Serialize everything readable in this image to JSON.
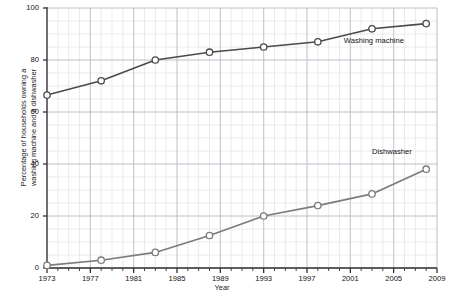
{
  "chart_data": {
    "type": "line",
    "title": "",
    "xlabel": "Year",
    "ylabel": "Percentage of households owning a washing machine and a dishwasher",
    "ylabel_line1": "Percentage of households owning a",
    "ylabel_line2": "washing machine and a dishwasher",
    "xlim": [
      1973,
      2009
    ],
    "ylim": [
      0,
      100
    ],
    "yticks": [
      0,
      20,
      40,
      60,
      80,
      100
    ],
    "xticks": [
      1973,
      1977,
      1981,
      1985,
      1989,
      1993,
      1997,
      2001,
      2005,
      2009
    ],
    "x_minor_step": 1,
    "y_minor_step": 5,
    "grid": true,
    "legend_position": "inline-annotation",
    "x": [
      1973,
      1978,
      1983,
      1988,
      1993,
      1998,
      2003,
      2008
    ],
    "series": [
      {
        "name": "Washing machine",
        "color": "#4a4a4a",
        "marker": "open-circle",
        "values": [
          66.5,
          72,
          80,
          83,
          85,
          87,
          92,
          94
        ]
      },
      {
        "name": "Dishwasher",
        "color": "#7b7b7b",
        "marker": "open-circle",
        "values": [
          1,
          3,
          6,
          12.5,
          20,
          24,
          28.5,
          38
        ]
      }
    ],
    "annotations": [
      {
        "text": "Washing machine",
        "x": 2000.4,
        "y": 87.5
      },
      {
        "text": "Dishwasher",
        "x": 2003.0,
        "y": 44.5
      }
    ],
    "colors": {
      "axis": "#333333",
      "grid_major": "#b9bcc4",
      "grid_minor": "#dcdee4",
      "text": "#111111",
      "background": "#ffffff"
    }
  }
}
